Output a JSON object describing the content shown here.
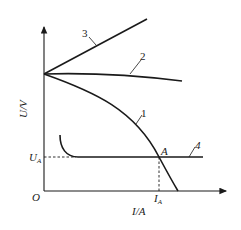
{
  "diagram": {
    "type": "U-I characteristic curves",
    "axes": {
      "y_label": "U/V",
      "x_label": "I/A",
      "origin_label": "O"
    },
    "curves": [
      {
        "id": "1",
        "label": "1",
        "shape": "falling curve (drooping)"
      },
      {
        "id": "2",
        "label": "2",
        "shape": "slightly falling, nearly flat"
      },
      {
        "id": "3",
        "label": "3",
        "shape": "rising straight line"
      },
      {
        "id": "4",
        "label": "4",
        "shape": "hooked then horizontal"
      }
    ],
    "intersection": {
      "point_label": "A",
      "u_label": "U",
      "u_sub": "A",
      "i_label": "I",
      "i_sub": "A"
    },
    "colors": {
      "line": "#1a1a1a",
      "background": "#ffffff"
    }
  }
}
